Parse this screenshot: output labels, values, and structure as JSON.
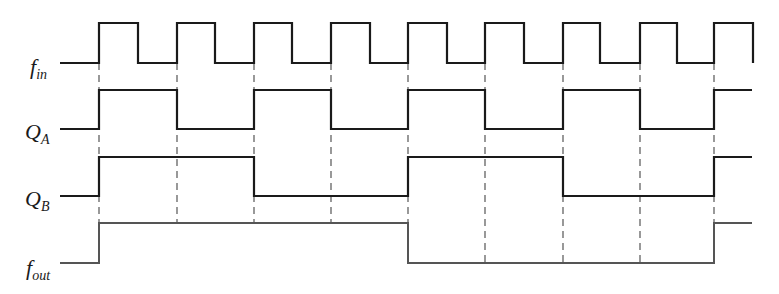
{
  "diagram": {
    "type": "timing-diagram",
    "colors": {
      "signal": "#1a1a1a",
      "fout_signal": "#555555",
      "guide": "#555555",
      "background": "#ffffff"
    },
    "edges_x": [
      99,
      177,
      254,
      331,
      408,
      485,
      563,
      640,
      714
    ],
    "signals": [
      {
        "id": "fin",
        "label_main": "f",
        "label_sub": "in",
        "label_pos": [
          28,
          56
        ],
        "levels": {
          "high": 23,
          "low": 63
        },
        "points": "97,63 99,63 99,23 138,23 138,63 177,63 177,23 215,23 215,63 254,63 254,23 292,23 292,63 331,63 331,23 370,23 370,63 408,63 408,23 447,23 447,63 485,63 485,23 524,23 524,63 563,63 563,23 600,23 600,63 640,63 640,23 677,23 677,63 714,63 714,23 753,23 753,63",
        "start_x": 60
      },
      {
        "id": "qa",
        "label_main": "Q",
        "label_sub": "A",
        "label_pos": [
          25,
          122
        ],
        "levels": {
          "high": 90,
          "low": 129
        },
        "points": "60,129 99,129 99,90 177,90 177,129 254,129 254,90 331,90 331,129 408,129 408,90 485,90 485,129 563,129 563,90 640,90 640,129 714,129 714,90 752,90"
      },
      {
        "id": "qb",
        "label_main": "Q",
        "label_sub": "B",
        "label_pos": [
          25,
          189
        ],
        "levels": {
          "high": 157,
          "low": 196
        },
        "points": "60,196 99,196 99,157 254,157 254,196 408,196 408,157 563,157 563,196 714,196 714,157 752,157"
      },
      {
        "id": "fout",
        "label_main": "f",
        "label_sub": "out",
        "label_pos": [
          25,
          258
        ],
        "levels": {
          "high": 223,
          "low": 263
        },
        "points": "60,263 99,263 99,223 408,223 408,263 714,263 714,223 752,223"
      }
    ],
    "guides": [
      {
        "x": 99,
        "y1": 63,
        "y2": 223
      },
      {
        "x": 177,
        "y1": 63,
        "y2": 223
      },
      {
        "x": 254,
        "y1": 63,
        "y2": 223
      },
      {
        "x": 331,
        "y1": 63,
        "y2": 223
      },
      {
        "x": 408,
        "y1": 63,
        "y2": 223
      },
      {
        "x": 485,
        "y1": 63,
        "y2": 263
      },
      {
        "x": 563,
        "y1": 63,
        "y2": 263
      },
      {
        "x": 640,
        "y1": 63,
        "y2": 263
      },
      {
        "x": 714,
        "y1": 63,
        "y2": 223
      }
    ]
  }
}
